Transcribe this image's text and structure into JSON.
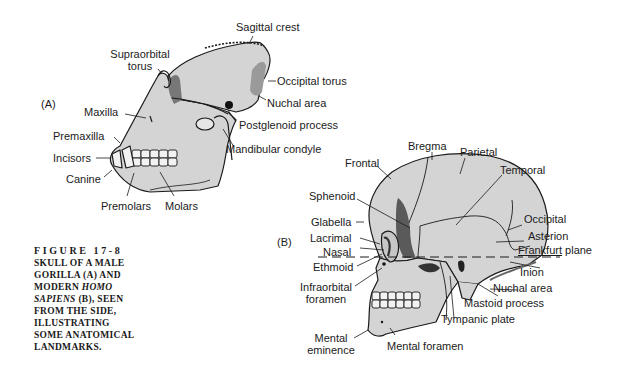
{
  "figure": {
    "number": "FIGURE 17-8",
    "caption_lines": [
      "SKULL OF A MALE",
      "GORILLA (A) AND",
      "MODERN",
      "HOMO",
      "SAPIENS",
      "(B), SEEN",
      "FROM THE SIDE,",
      "ILLUSTRATING",
      "SOME ANATOMICAL",
      "LANDMARKS."
    ]
  },
  "panel_a": {
    "tag": "(A)",
    "subject": "Male gorilla skull",
    "labels": {
      "sagittal_crest": "Sagittal crest",
      "supraorbital_torus_1": "Supraorbital",
      "supraorbital_torus_2": "torus",
      "occipital_torus": "Occipital torus",
      "nuchal_area": "Nuchal area",
      "maxilla": "Maxilla",
      "postglenoid_process": "Postglenoid process",
      "premaxilla": "Premaxilla",
      "mandibular_condyle": "Mandibular condyle",
      "incisors": "Incisors",
      "canine": "Canine",
      "premolars": "Premolars",
      "molars": "Molars"
    }
  },
  "panel_b": {
    "tag": "(B)",
    "subject": "Modern Homo sapiens skull",
    "labels": {
      "bregma": "Bregma",
      "parietal": "Parietal",
      "frontal": "Frontal",
      "temporal": "Temporal",
      "sphenoid": "Sphenoid",
      "occipital": "Occipital",
      "glabella": "Glabella",
      "asterion": "Asterion",
      "lacrimal": "Lacrimal",
      "frankfurt_a": "Frankfurt",
      "frankfurt_b": " plane",
      "nasal": "Nasal",
      "ethmoid": "Ethmoid",
      "inion": "Inion",
      "nuchal_area": "Nuchal area",
      "infraorbital_1": "Infraorbital",
      "infraorbital_2": "foramen",
      "mastoid_process": "Mastoid process",
      "tympanic_plate": "Tympanic plate",
      "mental_eminence_1": "Mental",
      "mental_eminence_2": "eminence",
      "mental_foramen": "Mental foramen"
    }
  },
  "colors": {
    "bone_fill": "#d4d4d4",
    "ink": "#1a1a1a",
    "shade": "#555555"
  }
}
